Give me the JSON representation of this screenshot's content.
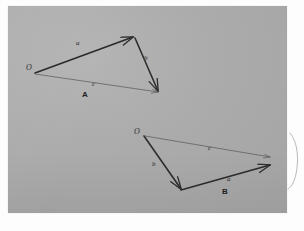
{
  "figure": {
    "title_a": "A",
    "title_b": "B",
    "paper_color": "#ababab",
    "ink_color": "#2c2c2c",
    "thin_ink_color": "#5a5a5a",
    "background_color": "#fdfdfd"
  },
  "diagram_a": {
    "name": "vector-triangle-a",
    "caption": "A",
    "origin_label": "O",
    "vectors": [
      {
        "id": "a",
        "label": "a",
        "style": "thick",
        "from": [
          35,
          73
        ],
        "to": [
          133,
          37
        ]
      },
      {
        "id": "b",
        "label": "b",
        "style": "thick",
        "from": [
          133,
          37
        ],
        "to": [
          158,
          91
        ]
      },
      {
        "id": "c",
        "label": "c",
        "style": "thin",
        "from": [
          35,
          73
        ],
        "to": [
          158,
          91
        ]
      }
    ],
    "label_positions": {
      "origin": [
        26,
        68
      ],
      "a": [
        76,
        43
      ],
      "b": [
        144,
        58
      ],
      "c": [
        92,
        84
      ],
      "caption": [
        82,
        95
      ]
    }
  },
  "diagram_b": {
    "name": "vector-triangle-b",
    "caption": "B",
    "origin_label": "O",
    "vectors": [
      {
        "id": "b",
        "label": "b",
        "style": "thick",
        "from": [
          144,
          136
        ],
        "to": [
          181,
          189
        ]
      },
      {
        "id": "a",
        "label": "a",
        "style": "thick",
        "from": [
          181,
          189
        ],
        "to": [
          270,
          165
        ]
      },
      {
        "id": "c",
        "label": "c",
        "style": "thin",
        "from": [
          144,
          136
        ],
        "to": [
          270,
          157
        ]
      }
    ],
    "label_positions": {
      "origin": [
        134,
        132
      ],
      "b": [
        152,
        164
      ],
      "a": [
        227,
        179
      ],
      "c": [
        208,
        148
      ],
      "caption": [
        222,
        191
      ]
    }
  },
  "margin_mark": {
    "name": "pen-stroke-margin",
    "description": "curved pen stroke on right white margin"
  }
}
